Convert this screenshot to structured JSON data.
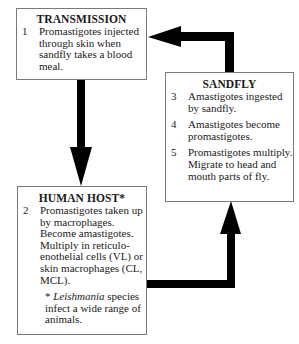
{
  "diagram": {
    "type": "life-cycle",
    "boxes": {
      "transmission": {
        "title": "TRANSMISSION",
        "items": [
          {
            "num": "1",
            "text": "Promastigotes injected through skin when sandfly takes a blood meal."
          }
        ]
      },
      "sandfly": {
        "title": "SANDFLY",
        "items": [
          {
            "num": "3",
            "text": "Amastigotes ingested by sandfly."
          },
          {
            "num": "4",
            "text": "Amastigotes become promastigotes."
          },
          {
            "num": "5",
            "text": "Promastigotes multiply. Migrate to head and mouth parts of fly."
          }
        ]
      },
      "human_host": {
        "title": "HUMAN HOST*",
        "items": [
          {
            "num": "2",
            "text": "Promastigotes taken up by macrophages. Become amastigotes. Multiply in reticulo-enothelial cells (VL) or skin macrophages (CL, MCL)."
          }
        ],
        "note_prefix": "* ",
        "note_italic": "Leishmania",
        "note_suffix": " species infect a wide range of animals."
      }
    },
    "arrows": [
      {
        "from": "transmission",
        "to": "human_host",
        "direction": "down"
      },
      {
        "from": "human_host",
        "to": "sandfly",
        "direction": "right-then-up"
      },
      {
        "from": "sandfly",
        "to": "transmission",
        "direction": "up-then-left"
      }
    ],
    "colors": {
      "arrow": "#000000",
      "border": "#7a7a7a",
      "background": "#ffffff"
    }
  }
}
